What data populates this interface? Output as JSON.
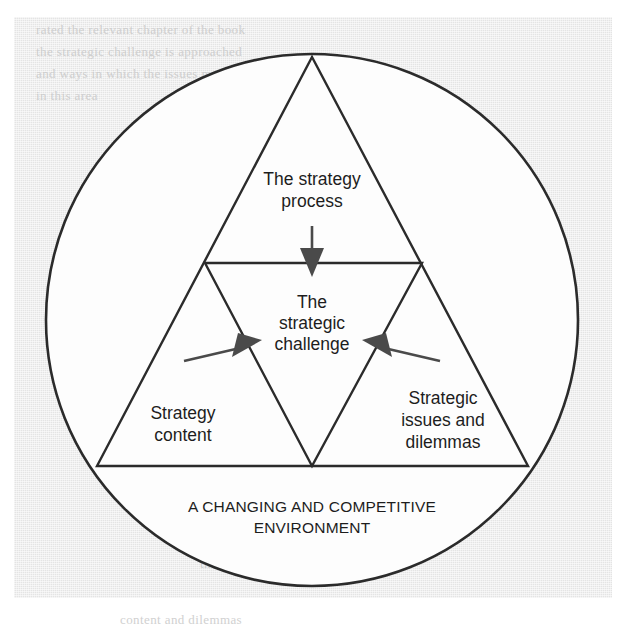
{
  "figure": {
    "outer_label": {
      "line1": "A CHANGING AND COMPETITIVE",
      "line2": "ENVIRONMENT"
    },
    "top_label": {
      "line1": "The strategy",
      "line2": "process"
    },
    "center_label": {
      "line1": "The",
      "line2": "strategic",
      "line3": "challenge"
    },
    "left_label": {
      "line1": "Strategy",
      "line2": "content"
    },
    "right_label": {
      "line1": "Strategic",
      "line2": "issues and",
      "line3": "dilemmas"
    }
  },
  "colors": {
    "page_background": "#ffffff",
    "scan_panel": "#e4e4e4",
    "ink": "#2b2b2b",
    "arrow": "#4a4a4a",
    "inner_field": "#fdfdfd",
    "ghost": "#c9c9c9"
  },
  "ghost_text": [
    {
      "text": "rated the relevant chapter of the book",
      "x": 36,
      "y": 22
    },
    {
      "text": "the strategic challenge is approached",
      "x": 36,
      "y": 44
    },
    {
      "text": "and ways in which the issues may",
      "x": 36,
      "y": 66
    },
    {
      "text": "in this area",
      "x": 36,
      "y": 88
    },
    {
      "text": "strategic",
      "x": 300,
      "y": 150
    },
    {
      "text": "and issues",
      "x": 150,
      "y": 300
    },
    {
      "text": "competitive",
      "x": 360,
      "y": 420
    },
    {
      "text": "the strategy process",
      "x": 200,
      "y": 556
    },
    {
      "text": "content and dilemmas",
      "x": 120,
      "y": 612
    }
  ],
  "chart_data": {
    "type": "diagram",
    "shape": "nested-triangles-in-circle",
    "elements": [
      {
        "name": "environment-circle",
        "role": "context boundary",
        "label": "A CHANGING AND COMPETITIVE ENVIRONMENT",
        "geometry": {
          "cx": 312,
          "cy": 320,
          "r": 266
        }
      },
      {
        "name": "outer-triangle",
        "role": "three dimensions of strategy",
        "geometry": {
          "apex": [
            312,
            57
          ],
          "base_left": [
            97,
            466
          ],
          "base_right": [
            528,
            466
          ]
        }
      },
      {
        "name": "inner-triangle",
        "role": "the strategic challenge at the centre",
        "geometry": {
          "top_left": [
            205,
            263
          ],
          "top_right": [
            422,
            263
          ],
          "apex": [
            312,
            466
          ]
        }
      },
      {
        "name": "top-vertex-label",
        "label": "The strategy process"
      },
      {
        "name": "left-vertex-label",
        "label": "Strategy content"
      },
      {
        "name": "right-vertex-label",
        "label": "Strategic issues and dilemmas"
      },
      {
        "name": "centre-label",
        "label": "The strategic challenge"
      }
    ],
    "arrows": [
      {
        "name": "arrow-from-process",
        "from": "The strategy process",
        "to": "The strategic challenge",
        "direction": "down"
      },
      {
        "name": "arrow-from-content",
        "from": "Strategy content",
        "to": "The strategic challenge",
        "direction": "up-right"
      },
      {
        "name": "arrow-from-issues",
        "from": "Strategic issues and dilemmas",
        "to": "The strategic challenge",
        "direction": "up-left"
      }
    ]
  }
}
